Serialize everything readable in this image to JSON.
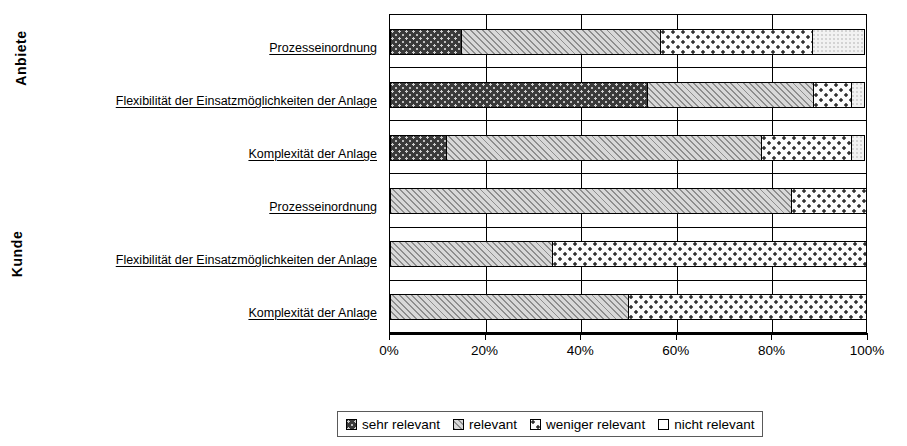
{
  "chart_data": {
    "type": "bar",
    "orientation": "horizontal",
    "stacked": "100%",
    "title": "",
    "xlabel": "",
    "ylabel": "",
    "xlim": [
      0,
      100
    ],
    "grid": true,
    "legend_position": "bottom",
    "group_axis": [
      {
        "name": "Anbieter",
        "label": "Anbiete"
      },
      {
        "name": "Kunde",
        "label": "Kunde"
      }
    ],
    "categories": [
      "Prozesseinordnung",
      "Flexibilität der Einsatzmöglichkeiten der Anlage",
      "Komplexität der Anlage",
      "Prozesseinordnung",
      "Flexibilität der Einsatzmöglichkeiten der Anlage",
      "Komplexität der Anlage"
    ],
    "series": [
      {
        "name": "sehr relevant",
        "pattern": "dark-speckle",
        "values": [
          15,
          54,
          12,
          0,
          0,
          0
        ]
      },
      {
        "name": "relevant",
        "pattern": "diagonal-hatch",
        "values": [
          42,
          35,
          66,
          84,
          34,
          50
        ]
      },
      {
        "name": "weniger relevant",
        "pattern": "dotted",
        "values": [
          32,
          8,
          19,
          16,
          66,
          50
        ]
      },
      {
        "name": "nicht relevant",
        "pattern": "blank",
        "values": [
          11,
          3,
          3,
          0,
          0,
          0
        ]
      }
    ],
    "xticks": [
      "0%",
      "20%",
      "40%",
      "60%",
      "80%",
      "100%"
    ],
    "xtick_values": [
      0,
      20,
      40,
      60,
      80,
      100
    ]
  },
  "legend": {
    "items": [
      {
        "label": "sehr relevant",
        "pattern": "dark-speckle"
      },
      {
        "label": "relevant",
        "pattern": "diagonal-hatch"
      },
      {
        "label": "weniger relevant",
        "pattern": "dotted"
      },
      {
        "label": "nicht relevant",
        "pattern": "blank"
      }
    ]
  }
}
